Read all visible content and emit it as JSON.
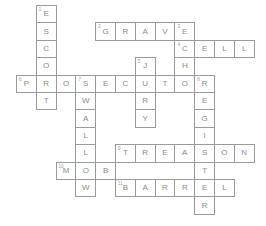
{
  "puzzle": {
    "type": "crossword",
    "grid": {
      "origin_x": 16,
      "origin_y": 5,
      "cell_w": 19.8,
      "cell_h": 17.4
    },
    "words": [
      {
        "number": 1,
        "direction": "down",
        "answer": "ESCORT",
        "row": 0,
        "col": 1
      },
      {
        "number": 2,
        "direction": "across",
        "answer": "GRAVE",
        "row": 1,
        "col": 4
      },
      {
        "number": 3,
        "direction": "down",
        "answer": "ECHO",
        "row": 1,
        "col": 8
      },
      {
        "number": 4,
        "direction": "across",
        "answer": "CELL",
        "row": 2,
        "col": 8
      },
      {
        "number": 5,
        "direction": "down",
        "answer": "JURY",
        "row": 3,
        "col": 6
      },
      {
        "number": 6,
        "direction": "across",
        "answer": "PROSECUTOR",
        "row": 4,
        "col": 0
      },
      {
        "number": 7,
        "direction": "down",
        "answer": "SWALLOW",
        "row": 4,
        "col": 3
      },
      {
        "number": 8,
        "direction": "down",
        "answer": "REGISTER",
        "row": 4,
        "col": 9
      },
      {
        "number": 9,
        "direction": "across",
        "answer": "TREASON",
        "row": 8,
        "col": 5
      },
      {
        "number": 10,
        "direction": "across",
        "answer": "MOB",
        "row": 9,
        "col": 2
      },
      {
        "number": 11,
        "direction": "across",
        "answer": "BARREL",
        "row": 10,
        "col": 5
      }
    ]
  }
}
